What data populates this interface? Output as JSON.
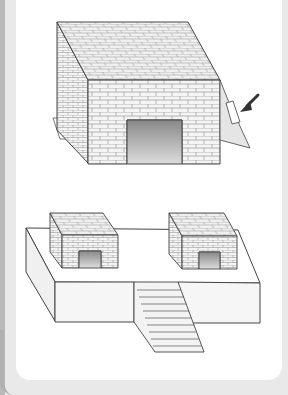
{
  "figure": {
    "top_illustration": {
      "name": "brick-shelter",
      "annotation": "arrow pointing to hinged flap"
    },
    "bottom_illustration": {
      "name": "platform-with-shelters",
      "shelter_count": 2,
      "stair_steps": 10
    }
  },
  "colors": {
    "background": "#e9e9e9",
    "panel": "#ffffff",
    "brick_face": "#f4f4f4",
    "line": "#555555",
    "arrow": "#333333"
  }
}
